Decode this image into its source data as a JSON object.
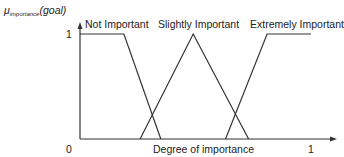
{
  "chart_data": {
    "type": "line",
    "title": "",
    "ylabel_main": "μ",
    "ylabel_sub": "importance",
    "ylabel_arg": "(goal)",
    "xlabel": "Degree of importance",
    "xlim": [
      0,
      1
    ],
    "ylim": [
      0,
      1
    ],
    "x_ticks": [
      "0",
      "1"
    ],
    "y_ticks": [
      "1"
    ],
    "grid": false,
    "legend": "inline labels above curves",
    "series": [
      {
        "name": "Not Important",
        "x": [
          0,
          0.19,
          0.35
        ],
        "y": [
          1,
          1,
          0
        ]
      },
      {
        "name": "Slightly Important",
        "x": [
          0.26,
          0.49,
          0.73
        ],
        "y": [
          0,
          1,
          0
        ]
      },
      {
        "name": "Extremely Important",
        "x": [
          0.63,
          0.81,
          1.0
        ],
        "y": [
          0,
          1,
          1
        ]
      }
    ],
    "line_color": "#333333"
  },
  "labels": {
    "y_tick_one": "1",
    "x_tick_zero": "0",
    "x_tick_one": "1",
    "xlabel": "Degree of importance",
    "series_0": "Not Important",
    "series_1": "Slightly Important",
    "series_2": "Extremely Important",
    "mu": "μ",
    "mu_sub": "importance",
    "mu_arg": "(goal)"
  }
}
